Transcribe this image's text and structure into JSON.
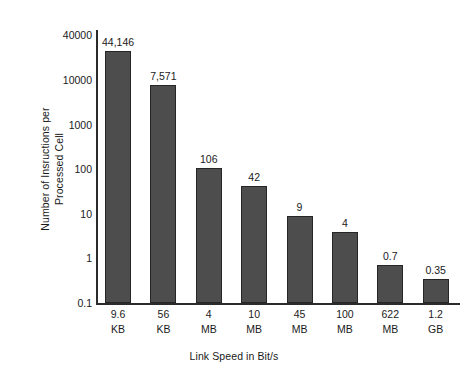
{
  "chart_data": {
    "type": "bar",
    "title": "",
    "xlabel": "Link Speed in Bit/s",
    "ylabel": "Number of Insructions per Processed Cell",
    "ylabel_line1": "Number of Insructions per",
    "ylabel_line2": "Processed Cell",
    "yscale": "log",
    "ylim": [
      0.1,
      100000
    ],
    "grid": false,
    "legend": null,
    "categories": [
      "9.6 KB",
      "56 KB",
      "4 MB",
      "10 MB",
      "45 MB",
      "100 MB",
      "622 MB",
      "1.2 GB"
    ],
    "category_parts": [
      {
        "number": "9.6",
        "unit": "KB"
      },
      {
        "number": "56",
        "unit": "KB"
      },
      {
        "number": "4",
        "unit": "MB"
      },
      {
        "number": "10",
        "unit": "MB"
      },
      {
        "number": "45",
        "unit": "MB"
      },
      {
        "number": "100",
        "unit": "MB"
      },
      {
        "number": "622",
        "unit": "MB"
      },
      {
        "number": "1.2",
        "unit": "GB"
      }
    ],
    "values": [
      44146,
      7571,
      106,
      42,
      9,
      4,
      0.7,
      0.35
    ],
    "value_labels": [
      "44,146",
      "7,571",
      "106",
      "42",
      "9",
      "4",
      "0.7",
      "0.35"
    ],
    "ytick_labels": [
      "40000",
      "10000",
      "1000",
      "100",
      "10",
      "1",
      "0.1"
    ],
    "ytick_values": [
      40000,
      10000,
      1000,
      100,
      10,
      1,
      0.1
    ],
    "bar_color": "#4d4d4d",
    "bar_border_color": "#262626",
    "axis_color": "#2b2b2b",
    "background_color": "#ffffff",
    "text_color": "#1a1a1a"
  }
}
